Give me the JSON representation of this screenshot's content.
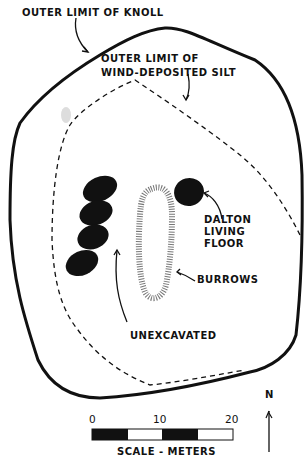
{
  "labels": {
    "knoll": "OUTER LIMIT OF KNOLL",
    "silt_line1": "OUTER LIMIT OF",
    "silt_line2": "WIND-DEPOSITED SILT",
    "dalton_line1": "DALTON",
    "dalton_line2": "LIVING",
    "dalton_line3": "FLOOR",
    "burrows": "BURROWS",
    "unexcavated": "UNEXCAVATED",
    "north": "N"
  },
  "scale": {
    "ticks": [
      "0",
      "10",
      "20"
    ],
    "caption": "SCALE - METERS",
    "units": "meters"
  },
  "colors": {
    "ink": "#111111",
    "paper": "#ffffff"
  }
}
